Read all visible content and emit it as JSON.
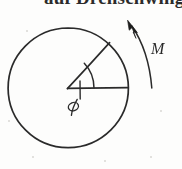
{
  "figure": {
    "kind": "hand-drawn-mechanics-diagram",
    "background_color": "#fdfdfc",
    "ink_color": "#2b2b2b",
    "heading": {
      "text": "auf Drehschwing",
      "visible_fragment": "clipped-bottom-of-letters",
      "font_size_px": 19
    },
    "circle": {
      "center_x": 68,
      "center_y": 88,
      "radius": 60,
      "stroke_width": 1.6,
      "stroke_color": "#2b2b2b"
    },
    "radii": [
      {
        "name": "horizontal-radius",
        "from_x": 68,
        "from_y": 88,
        "to_x": 128,
        "to_y": 88,
        "angle_deg": 0
      },
      {
        "name": "inclined-radius",
        "from_x": 68,
        "from_y": 88,
        "to_x": 110,
        "to_y": 43,
        "angle_deg": 47
      }
    ],
    "angle_arc": {
      "label": "φ",
      "label_x": 74,
      "label_y": 110,
      "radius": 26,
      "start_angle_deg": 0,
      "end_angle_deg": 47,
      "tick_length": 14
    },
    "moment_arrow": {
      "label": "M",
      "label_x": 156,
      "label_y": 48,
      "direction": "counter-clockwise",
      "tail_x": 152,
      "tail_y": 88,
      "tip_x": 129,
      "tip_y": 22,
      "arrowhead": "filled-triangle"
    },
    "specks": [
      {
        "x": 26,
        "y": 30,
        "r": 1.1
      },
      {
        "x": 160,
        "y": 110,
        "r": 1.0
      },
      {
        "x": 32,
        "y": 156,
        "r": 1.1
      },
      {
        "x": 104,
        "y": 160,
        "r": 0.9
      },
      {
        "x": 150,
        "y": 156,
        "r": 0.9
      },
      {
        "x": 8,
        "y": 120,
        "r": 0.8
      }
    ]
  }
}
